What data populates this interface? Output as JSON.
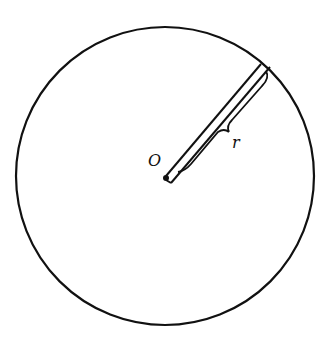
{
  "diagram": {
    "center_label": "O",
    "radius_label": "r",
    "colors": {
      "stroke": "#111111",
      "background": "#ffffff"
    }
  }
}
